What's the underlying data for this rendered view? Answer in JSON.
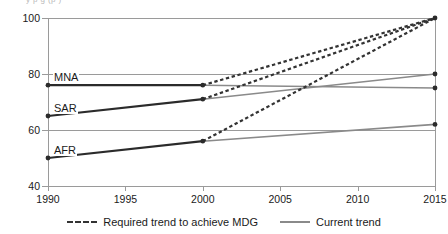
{
  "clipped_title_fragment": "y      p            g  (p      )",
  "chart_data": {
    "type": "line",
    "title": "",
    "xlabel": "",
    "ylabel": "",
    "xlim": [
      1990,
      2015
    ],
    "ylim": [
      40,
      100
    ],
    "x_ticks": [
      1990,
      1995,
      2000,
      2005,
      2010,
      2015
    ],
    "y_ticks": [
      40,
      60,
      80,
      100
    ],
    "grid": "horizontal",
    "legend_position": "bottom-center",
    "legend": [
      {
        "label": "Required trend to achieve MDG",
        "style": "dashed",
        "color": "#333333"
      },
      {
        "label": "Current trend",
        "style": "solid",
        "color": "#8a8a8a"
      }
    ],
    "region_labels": [
      "MNA",
      "SAR",
      "AFR"
    ],
    "series": [
      {
        "name": "MNA historical",
        "region": "MNA",
        "style": "solid",
        "color": "#2b2b2b",
        "x": [
          1990,
          2000
        ],
        "values": [
          76,
          76
        ]
      },
      {
        "name": "SAR historical",
        "region": "SAR",
        "style": "solid",
        "color": "#2b2b2b",
        "x": [
          1990,
          2000
        ],
        "values": [
          65,
          71
        ]
      },
      {
        "name": "AFR historical",
        "region": "AFR",
        "style": "solid",
        "color": "#2b2b2b",
        "x": [
          1990,
          2000
        ],
        "values": [
          50,
          56
        ]
      },
      {
        "name": "MNA current trend",
        "region": "MNA",
        "style": "solid",
        "color": "#8a8a8a",
        "x": [
          2000,
          2015
        ],
        "values": [
          76,
          75
        ]
      },
      {
        "name": "SAR current trend",
        "region": "SAR",
        "style": "solid",
        "color": "#8a8a8a",
        "x": [
          2000,
          2015
        ],
        "values": [
          71,
          80
        ]
      },
      {
        "name": "AFR current trend",
        "region": "AFR",
        "style": "solid",
        "color": "#8a8a8a",
        "x": [
          2000,
          2015
        ],
        "values": [
          56,
          62
        ]
      },
      {
        "name": "MNA required trend to achieve MDG",
        "region": "MNA",
        "style": "dashed",
        "color": "#333333",
        "x": [
          2000,
          2015
        ],
        "values": [
          76,
          100
        ]
      },
      {
        "name": "SAR required trend to achieve MDG",
        "region": "SAR",
        "style": "dashed",
        "color": "#333333",
        "x": [
          2000,
          2015
        ],
        "values": [
          71,
          100
        ]
      },
      {
        "name": "AFR required trend to achieve MDG",
        "region": "AFR",
        "style": "dashed",
        "color": "#333333",
        "x": [
          2000,
          2015
        ],
        "values": [
          56,
          100
        ]
      }
    ],
    "markers": [
      {
        "series": "MNA historical",
        "x": 1990,
        "y": 76
      },
      {
        "series": "MNA historical",
        "x": 2000,
        "y": 76
      },
      {
        "series": "SAR historical",
        "x": 1990,
        "y": 65
      },
      {
        "series": "SAR historical",
        "x": 2000,
        "y": 71
      },
      {
        "series": "AFR historical",
        "x": 1990,
        "y": 50
      },
      {
        "series": "AFR historical",
        "x": 2000,
        "y": 56
      },
      {
        "series": "MNA current trend",
        "x": 2015,
        "y": 75
      },
      {
        "series": "SAR current trend",
        "x": 2015,
        "y": 80
      },
      {
        "series": "AFR current trend",
        "x": 2015,
        "y": 62
      },
      {
        "series": "required trend endpoint",
        "x": 2015,
        "y": 100
      }
    ]
  }
}
